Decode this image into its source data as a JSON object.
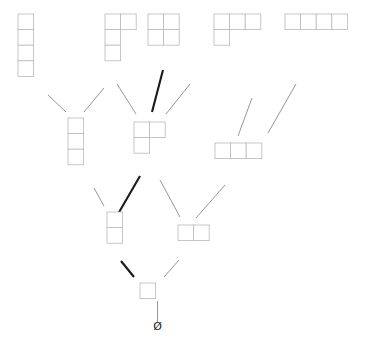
{
  "diagram": {
    "bottom_label": "Ø",
    "cell_size": 15.6,
    "colors": {
      "background": "#ffffff",
      "cell_fill": "#ffffff",
      "cell_stroke": "#b9b9b9",
      "edge_normal": "#8a8a8a",
      "edge_bold": "#1a1a1a",
      "label": "#1b1b1b"
    },
    "nodes": [
      {
        "id": "empty",
        "label": "Ø",
        "rank": 0,
        "partition": [],
        "x": 157.5,
        "y": 330.0,
        "kind": "text"
      },
      {
        "id": "p1",
        "label": "1",
        "rank": 1,
        "partition": [
          1
        ],
        "x": 140.0,
        "y": 283.0,
        "kind": "diagram"
      },
      {
        "id": "p2",
        "label": "2",
        "rank": 2,
        "partition": [
          2
        ],
        "x": 178.0,
        "y": 225.0,
        "kind": "diagram"
      },
      {
        "id": "p11",
        "label": "11",
        "rank": 2,
        "partition": [
          1,
          1
        ],
        "x": 107.0,
        "y": 212.0,
        "kind": "diagram"
      },
      {
        "id": "p3",
        "label": "3",
        "rank": 3,
        "partition": [
          3
        ],
        "x": 215.0,
        "y": 143.0,
        "kind": "diagram"
      },
      {
        "id": "p21",
        "label": "21",
        "rank": 3,
        "partition": [
          2,
          1
        ],
        "x": 134.0,
        "y": 122.0,
        "kind": "diagram"
      },
      {
        "id": "p111",
        "label": "111",
        "rank": 3,
        "partition": [
          1,
          1,
          1
        ],
        "x": 68.0,
        "y": 118.0,
        "kind": "diagram"
      },
      {
        "id": "p4",
        "label": "4",
        "rank": 4,
        "partition": [
          4
        ],
        "x": 285.0,
        "y": 14.0,
        "kind": "diagram"
      },
      {
        "id": "p31",
        "label": "31",
        "rank": 4,
        "partition": [
          3,
          1
        ],
        "x": 214.0,
        "y": 14.0,
        "kind": "diagram"
      },
      {
        "id": "p22",
        "label": "22",
        "rank": 4,
        "partition": [
          2,
          2
        ],
        "x": 148.0,
        "y": 14.0,
        "kind": "diagram"
      },
      {
        "id": "p211",
        "label": "211",
        "rank": 4,
        "partition": [
          2,
          1,
          1
        ],
        "x": 105.0,
        "y": 14.0,
        "kind": "diagram"
      },
      {
        "id": "p1111",
        "label": "1111",
        "rank": 4,
        "partition": [
          1,
          1,
          1,
          1
        ],
        "x": 18.0,
        "y": 14.0,
        "kind": "diagram"
      }
    ],
    "edges": [
      {
        "from": "empty",
        "to": "p1",
        "x1": 157.5,
        "y1": 322.0,
        "x2": 157.5,
        "y2": 301.0,
        "bold": false
      },
      {
        "from": "p1",
        "to": "p11",
        "x1": 134.0,
        "y1": 277.0,
        "x2": 121.0,
        "y2": 261.0,
        "bold": true
      },
      {
        "from": "p1",
        "to": "p2",
        "x1": 164.0,
        "y1": 277.0,
        "x2": 179.0,
        "y2": 260.0,
        "bold": false
      },
      {
        "from": "p11",
        "to": "p111",
        "x1": 104.0,
        "y1": 206.0,
        "x2": 94.0,
        "y2": 188.0,
        "bold": false
      },
      {
        "from": "p11",
        "to": "p21",
        "x1": 118.0,
        "y1": 214.0,
        "x2": 140.0,
        "y2": 176.0,
        "bold": true
      },
      {
        "from": "p2",
        "to": "p21",
        "x1": 180.0,
        "y1": 217.0,
        "x2": 160.0,
        "y2": 180.0,
        "bold": false
      },
      {
        "from": "p2",
        "to": "p3",
        "x1": 196.0,
        "y1": 218.0,
        "x2": 225.0,
        "y2": 185.0,
        "bold": false
      },
      {
        "from": "p111",
        "to": "p1111",
        "x1": 66.0,
        "y1": 112.0,
        "x2": 48.0,
        "y2": 95.0,
        "bold": false
      },
      {
        "from": "p111",
        "to": "p211",
        "x1": 84.0,
        "y1": 112.0,
        "x2": 104.0,
        "y2": 88.0,
        "bold": false
      },
      {
        "from": "p21",
        "to": "p211",
        "x1": 136.0,
        "y1": 114.0,
        "x2": 117.0,
        "y2": 84.0,
        "bold": false
      },
      {
        "from": "p21",
        "to": "p22",
        "x1": 152.0,
        "y1": 112.0,
        "x2": 163.0,
        "y2": 70.0,
        "bold": true
      },
      {
        "from": "p21",
        "to": "p31",
        "x1": 166.0,
        "y1": 114.0,
        "x2": 190.0,
        "y2": 84.0,
        "bold": false
      },
      {
        "from": "p3",
        "to": "p31",
        "x1": 238.0,
        "y1": 136.0,
        "x2": 252.0,
        "y2": 98.0,
        "bold": false
      },
      {
        "from": "p3",
        "to": "p4",
        "x1": 268.0,
        "y1": 133.0,
        "x2": 296.0,
        "y2": 84.0,
        "bold": false
      }
    ],
    "bold_chain": [
      "empty",
      "p1",
      "p11",
      "p21",
      "p22"
    ]
  }
}
